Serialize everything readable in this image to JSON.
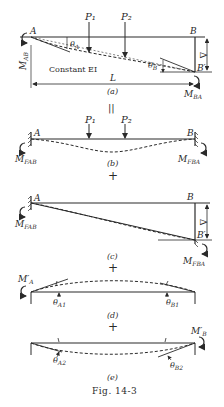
{
  "figure": {
    "caption": "Fig. 14-3",
    "operators": {
      "equals": "||",
      "plus": "+"
    }
  },
  "panels": {
    "a": {
      "label": "(a)",
      "nodes": {
        "A": "A",
        "B": "B",
        "B_prime": "B′"
      },
      "loads": [
        "P₁",
        "P₂"
      ],
      "moments": {
        "left": "M_AB",
        "right": "M_BA"
      },
      "moment_labels": {
        "left": "M",
        "left_sub": "AB",
        "right": "M",
        "right_sub": "BA"
      },
      "angles": {
        "A": "θ",
        "A_sub": "A",
        "B": "θ",
        "B_sub": "B"
      },
      "note": "Constant EI",
      "span": "L",
      "settlement": "Δ"
    },
    "b": {
      "label": "(b)",
      "nodes": {
        "A": "A",
        "B": "B"
      },
      "loads": [
        "P₁",
        "P₂"
      ],
      "moment_labels": {
        "left": "M",
        "left_sub": "FAB",
        "right": "M",
        "right_sub": "FBA"
      }
    },
    "c": {
      "label": "(c)",
      "nodes": {
        "A": "A",
        "B": "B",
        "B_prime": "B′"
      },
      "settlement": "Δ",
      "moment_labels": {
        "left": "M",
        "left_sub": "FAB",
        "right": "M",
        "right_sub": "FBA"
      }
    },
    "d": {
      "label": "(d)",
      "moment_labels": {
        "left": "M′",
        "left_sub": "A"
      },
      "angles": {
        "A": "θ",
        "A_sub": "A1",
        "B": "θ",
        "B_sub": "B1"
      }
    },
    "e": {
      "label": "(e)",
      "moment_labels": {
        "right": "M′",
        "right_sub": "B"
      },
      "angles": {
        "A": "θ",
        "A_sub": "A2",
        "B": "θ",
        "B_sub": "B2"
      }
    }
  }
}
